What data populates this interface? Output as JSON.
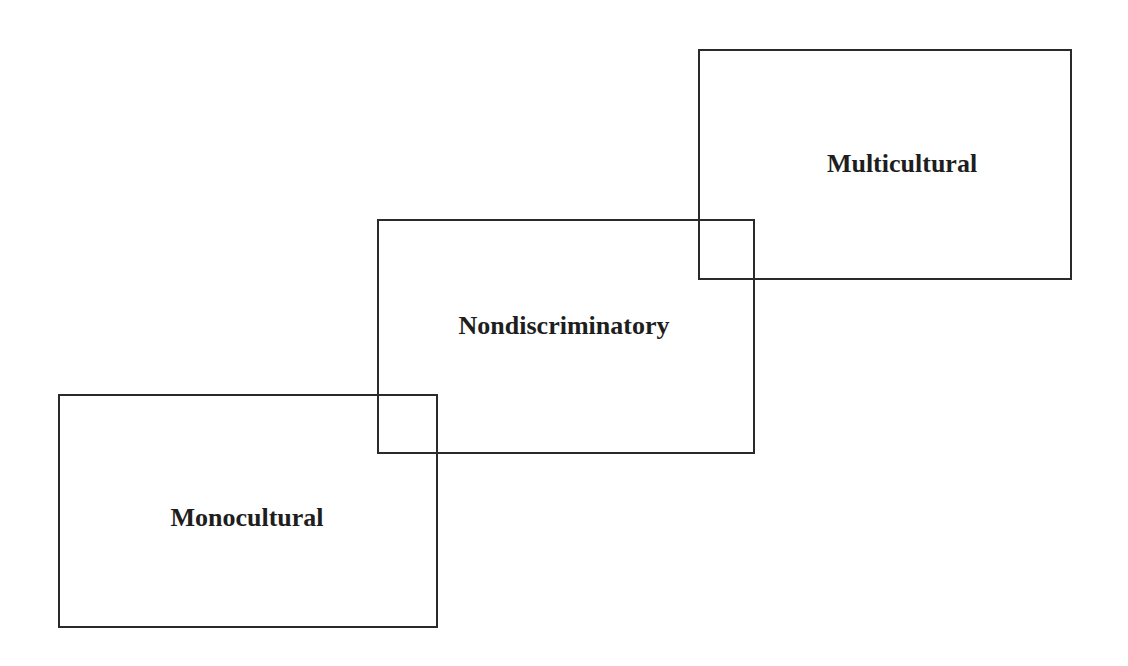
{
  "diagram": {
    "stroke_color": "#2a2a2a",
    "text_color": "#1e1e1e",
    "boxes": [
      {
        "id": "monocultural",
        "label": "Monocultural",
        "position": "bottom-left"
      },
      {
        "id": "nondiscriminatory",
        "label": "Nondiscriminatory",
        "position": "middle"
      },
      {
        "id": "multicultural",
        "label": "Multicultural",
        "position": "top-right"
      }
    ]
  }
}
